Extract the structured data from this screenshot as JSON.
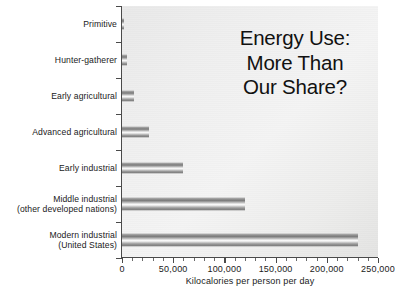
{
  "chart_data": {
    "type": "bar",
    "orientation": "horizontal",
    "title_lines": [
      "Energy Use:",
      "More Than",
      "Our Share?"
    ],
    "xlabel": "Kilocalories per person per day",
    "ylabel": "",
    "categories": [
      "Primitive",
      "Hunter-gatherer",
      "Early agricultural",
      "Advanced agricultural",
      "Early industrial",
      "Middle industrial\n(other developed nations)",
      "Modern industrial\n(United States)"
    ],
    "category_lines": [
      [
        "Primitive"
      ],
      [
        "Hunter-gatherer"
      ],
      [
        "Early agricultural"
      ],
      [
        "Advanced agricultural"
      ],
      [
        "Early industrial"
      ],
      [
        "Middle industrial",
        "(other developed nations)"
      ],
      [
        "Modern industrial",
        "(United States)"
      ]
    ],
    "values": [
      2000,
      5000,
      12000,
      26000,
      60000,
      120000,
      230000
    ],
    "xlim": [
      0,
      250000
    ],
    "xticks": [
      0,
      50000,
      100000,
      150000,
      200000,
      250000
    ],
    "xtick_labels": [
      "0",
      "50,000",
      "100,000",
      "150,000",
      "200,000",
      "250,000"
    ],
    "grid": false,
    "legend": false,
    "bar_color": "#8e8e8e",
    "plot_background": "#efefef",
    "text_color": "#1a1a1a"
  },
  "axis": {
    "x_title": "Kilocalories per person per day"
  }
}
